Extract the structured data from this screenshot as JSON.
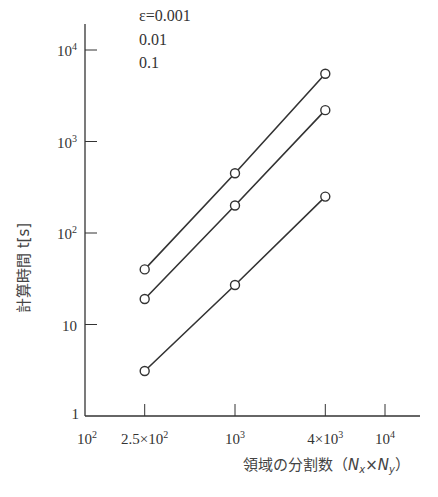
{
  "chart_data": {
    "type": "line",
    "title": "",
    "xlabel": "領域の分割数（N_x×N_y）",
    "ylabel": "計算時間 t[s]",
    "xscale": "log",
    "yscale": "log",
    "xlim": [
      100,
      20000
    ],
    "ylim": [
      1,
      20000
    ],
    "x_ticks": [
      {
        "value": 100,
        "label": "10",
        "sup": "2",
        "prefix": ""
      },
      {
        "value": 250,
        "label": "2.5×10",
        "sup": "2",
        "prefix": ""
      },
      {
        "value": 1000,
        "label": "10",
        "sup": "3",
        "prefix": ""
      },
      {
        "value": 4000,
        "label": "4×10",
        "sup": "3",
        "prefix": ""
      },
      {
        "value": 10000,
        "label": "10",
        "sup": "4",
        "prefix": ""
      }
    ],
    "y_ticks": [
      {
        "value": 1,
        "label": "1",
        "sup": ""
      },
      {
        "value": 10,
        "label": "10",
        "sup": ""
      },
      {
        "value": 100,
        "label": "10",
        "sup": "2"
      },
      {
        "value": 1000,
        "label": "10",
        "sup": "3"
      },
      {
        "value": 10000,
        "label": "10",
        "sup": "4"
      }
    ],
    "x": [
      250,
      1000,
      4000
    ],
    "series": [
      {
        "name": "ε=0.001",
        "legend_label": "ε=0.001",
        "values": [
          40,
          450,
          5500
        ]
      },
      {
        "name": "ε=0.01",
        "legend_label": "0.01",
        "values": [
          19,
          200,
          2200
        ]
      },
      {
        "name": "ε=0.1",
        "legend_label": "0.1",
        "values": [
          3.1,
          27,
          250
        ]
      }
    ],
    "marker": "open-circle",
    "grid": false,
    "legend_position": "top-left-inside",
    "line_color": "#333333"
  }
}
